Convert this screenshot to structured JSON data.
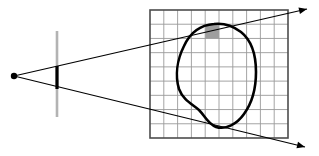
{
  "figure": {
    "title": "Ray casting through an image plane onto a pixel grid containing an object silhouette",
    "background_color": "#ffffff",
    "width": 319,
    "height": 156
  },
  "eye": {
    "label": "eye-point",
    "color": "#000000",
    "x": 14,
    "y": 76,
    "radius": 3.2
  },
  "image_plane": {
    "label": "image-plane",
    "color": "#b3b3b3",
    "stroke_width": 2.6,
    "x": 57,
    "y_top": 31,
    "y_bottom": 117
  },
  "pixel_segment": {
    "label": "highlighted-pixel-on-image-plane",
    "color": "#000000",
    "stroke_width": 3.2,
    "x": 57,
    "y_top": 66,
    "y_bottom": 89
  },
  "rays": {
    "color": "#000000",
    "stroke_width": 1.2,
    "items": [
      {
        "name": "upper-ray",
        "from_x": 14,
        "from_y": 76,
        "to_x": 307,
        "to_y": 9,
        "arrow": true
      },
      {
        "name": "lower-ray",
        "from_x": 14,
        "from_y": 76,
        "to_x": 305,
        "to_y": 147,
        "arrow": true
      }
    ],
    "arrow_size": 8
  },
  "grid": {
    "label": "pixel-grid",
    "x": 150,
    "y": 10,
    "width": 138,
    "height": 128,
    "columns": 10,
    "rows": 9,
    "line_color": "#9a9a9a",
    "line_width": 0.9,
    "border_color": "#4d4d4d",
    "border_width": 1.6,
    "fill": "#ffffff"
  },
  "shaded_cell": {
    "label": "shaded-pixel-cell",
    "column_index": 4,
    "row_index": 1,
    "x": 208,
    "y": 24,
    "width": 14,
    "height": 14,
    "fill": "#9e9e9e"
  },
  "object_outline": {
    "label": "object-silhouette",
    "color": "#000000",
    "stroke_width": 2.6,
    "fill": "none",
    "path": "M 214 24 C 200 25 190 33 184 46 C 177 60 175 76 179 89 C 183 100 192 104 199 110 C 205 116 208 124 216 127 C 226 130 237 124 244 114 C 252 103 256 88 256 72 C 256 55 251 40 241 32 C 233 26 223 23 214 24 Z"
  },
  "colors": {
    "ink": "#000000",
    "grid_line": "#9a9a9a",
    "grid_border": "#4d4d4d",
    "plane": "#b3b3b3",
    "shade": "#9e9e9e",
    "background": "#ffffff"
  }
}
